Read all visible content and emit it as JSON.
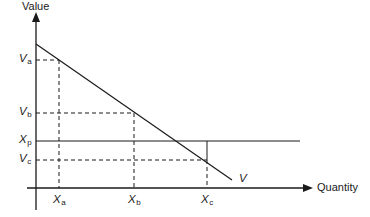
{
  "diagram": {
    "axes": {
      "y_label": "Value",
      "x_label": "Quantity"
    },
    "curve_label": "V",
    "y_markers": [
      {
        "id": "Va",
        "base": "V",
        "sub": "a",
        "style": "dashed"
      },
      {
        "id": "Vb",
        "base": "V",
        "sub": "b",
        "style": "dashed"
      },
      {
        "id": "Xp",
        "base": "X",
        "sub": "p",
        "style": "solid"
      },
      {
        "id": "Vc",
        "base": "V",
        "sub": "c",
        "style": "dashed"
      }
    ],
    "x_markers": [
      {
        "id": "Xa",
        "base": "X",
        "sub": "a"
      },
      {
        "id": "Xb",
        "base": "X",
        "sub": "b"
      },
      {
        "id": "Xc",
        "base": "X",
        "sub": "c"
      }
    ],
    "colors": {
      "line": "#1a1a1a",
      "background": "#ffffff"
    }
  }
}
